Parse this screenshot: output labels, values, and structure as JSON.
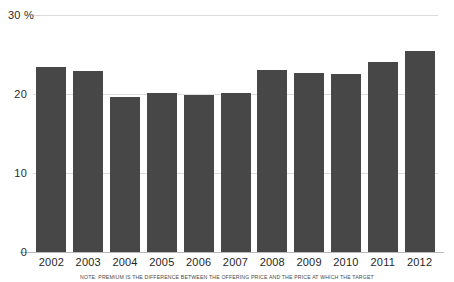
{
  "chart_data": {
    "type": "bar",
    "title": "",
    "subtitle": "",
    "xlabel": "",
    "ylabel": "",
    "unit_label": "30 %",
    "categories": [
      "2002",
      "2003",
      "2004",
      "2005",
      "2006",
      "2007",
      "2008",
      "2009",
      "2010",
      "2011",
      "2012"
    ],
    "values": [
      23.4,
      22.9,
      19.6,
      20.1,
      19.9,
      20.1,
      23.0,
      22.6,
      22.5,
      24.0,
      25.4
    ],
    "series": [
      {
        "name": "Premium",
        "values": [
          23.4,
          22.9,
          19.6,
          20.1,
          19.9,
          20.1,
          23.0,
          22.6,
          22.5,
          24.0,
          25.4
        ]
      }
    ],
    "ylim": [
      0,
      30
    ],
    "yticks": [
      0,
      10,
      20,
      30
    ],
    "ytick_labels": [
      "0",
      "10",
      "20",
      "30 %"
    ],
    "grid": true,
    "legend": "none",
    "bar_color": "#474747",
    "gridline_color": "#dcdcdc",
    "axis_color": "#b9b9b9",
    "background": "#ffffff"
  },
  "axis": {
    "y_ticks": [
      {
        "label": "30 %",
        "value": 30
      },
      {
        "label": "20",
        "value": 20
      },
      {
        "label": "10",
        "value": 10
      },
      {
        "label": "0",
        "value": 0
      }
    ]
  },
  "note": {
    "text": "NOTE: PREMIUM IS THE DIFFERENCE BETWEEN THE OFFERING PRICE AND THE PRICE AT WHICH THE TARGET"
  }
}
